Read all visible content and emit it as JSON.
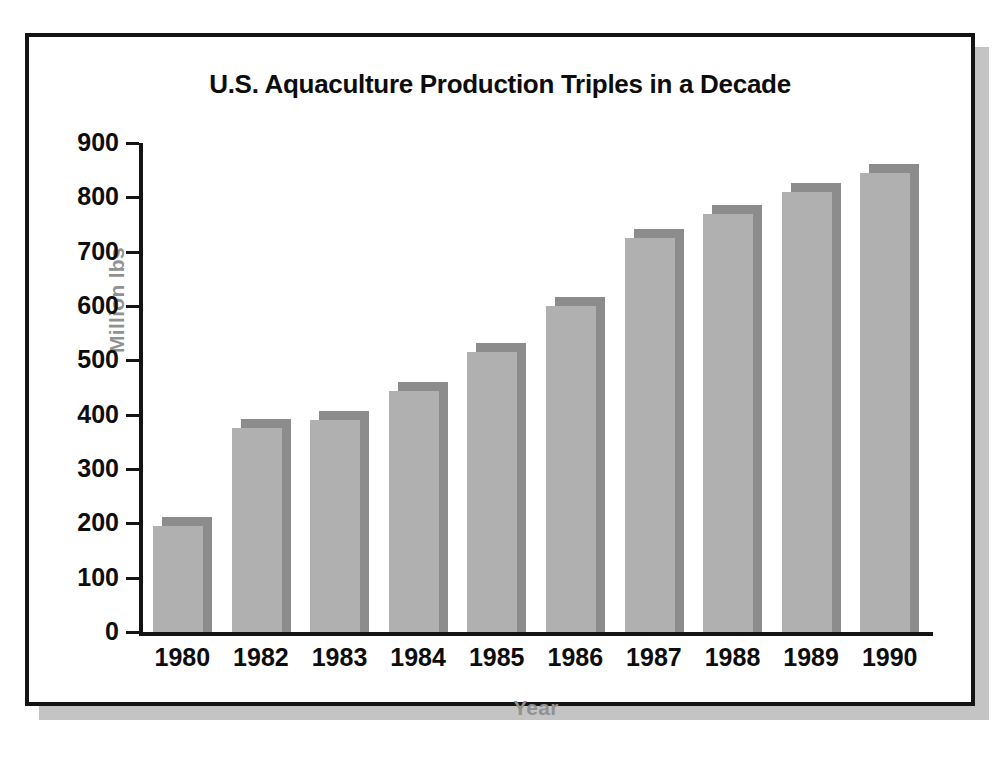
{
  "chart_data": {
    "type": "bar",
    "title": "U.S. Aquaculture Production Triples in a Decade",
    "xlabel": "Year",
    "ylabel": "Million lbs",
    "categories": [
      "1980",
      "1982",
      "1983",
      "1984",
      "1985",
      "1986",
      "1987",
      "1988",
      "1989",
      "1990"
    ],
    "values": [
      195,
      375,
      390,
      443,
      515,
      600,
      725,
      770,
      810,
      845
    ],
    "ylim": [
      0,
      900
    ],
    "yticks": [
      0,
      100,
      200,
      300,
      400,
      500,
      600,
      700,
      800,
      900
    ],
    "ytick_labels": [
      "0",
      "100",
      "200",
      "300",
      "400",
      "500",
      "600",
      "700",
      "800",
      "900"
    ],
    "grid": false,
    "legend": false,
    "series": [
      {
        "name": "U.S. Aquaculture Production",
        "values": [
          195,
          375,
          390,
          443,
          515,
          600,
          725,
          770,
          810,
          845
        ]
      }
    ],
    "colors": {
      "bar_front": "#b0b0b0",
      "bar_shade": "#8c8c8c",
      "axis": "#141414",
      "title_text": "#0d0d0d",
      "axis_title_text": "#919191",
      "frame": "#141414",
      "shadow": "#c4c4c4",
      "background": "#ffffff"
    }
  }
}
